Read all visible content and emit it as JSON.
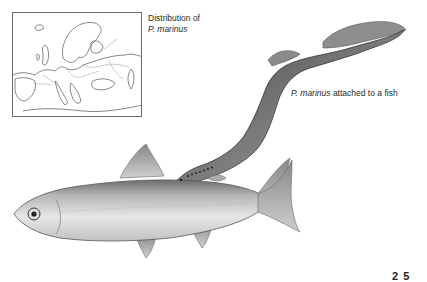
{
  "map": {
    "caption_line1": "Distribution of",
    "caption_line2": "P. marinus"
  },
  "illustration": {
    "caption_species": "P. marinus",
    "caption_rest": " attached to a fish"
  },
  "page": {
    "number_fragment": "2 5"
  },
  "colors": {
    "background": "#ffffff",
    "ink": "#2a2a2a",
    "map_line": "#6a6a6a"
  }
}
